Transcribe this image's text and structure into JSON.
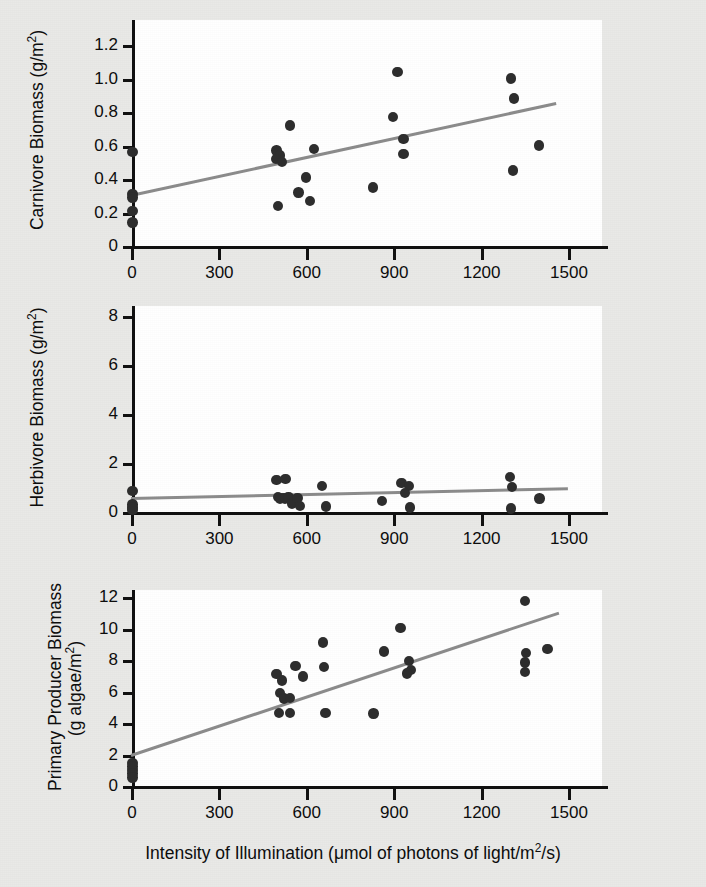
{
  "figure": {
    "background_color": "#e9e9e7",
    "plot_background_color": "#ffffff",
    "point_color": "#2e2e2e",
    "trend_color": "#8c8c8c",
    "axis_color": "#111111",
    "xlabel_main": "Intensity of Illumination (",
    "xlabel_mu": "μ",
    "xlabel_mid": "mol of photons of light/m",
    "xlabel_sup": "2",
    "xlabel_end": "/s)"
  },
  "xaxis": {
    "ticks": [
      0,
      300,
      600,
      900,
      1200,
      1500
    ],
    "tick_labels": [
      "0",
      "300",
      "600",
      "900",
      "1200",
      "1500"
    ],
    "min": 0,
    "max": 1560,
    "label": "Intensity of Illumination (μmol of photons of light/m2/s)"
  },
  "chart_data": [
    {
      "type": "scatter",
      "panel": 1,
      "title": "",
      "ylabel": "Carnivore Biomass (g/m2)",
      "ylabel_prefix": "Carnivore Biomass (g/m",
      "ylabel_sup": "2",
      "ylabel_suffix": ")",
      "xlabel": "",
      "ylim": [
        0,
        1.32
      ],
      "xlim": [
        0,
        1560
      ],
      "yticks": [
        0,
        0.2,
        0.4,
        0.6,
        0.8,
        1.0,
        1.2
      ],
      "ytick_labels": [
        "0",
        "0.2",
        "0.4",
        "0.6",
        "0.8",
        "1.0",
        "1.2"
      ],
      "grid": false,
      "legend": "none",
      "points": [
        {
          "x": 5,
          "y": 0.56
        },
        {
          "x": 5,
          "y": 0.31
        },
        {
          "x": 5,
          "y": 0.29
        },
        {
          "x": 5,
          "y": 0.21
        },
        {
          "x": 5,
          "y": 0.14
        },
        {
          "x": 500,
          "y": 0.57
        },
        {
          "x": 512,
          "y": 0.54
        },
        {
          "x": 498,
          "y": 0.52
        },
        {
          "x": 518,
          "y": 0.5
        },
        {
          "x": 505,
          "y": 0.24
        },
        {
          "x": 545,
          "y": 0.72
        },
        {
          "x": 575,
          "y": 0.32
        },
        {
          "x": 600,
          "y": 0.41
        },
        {
          "x": 615,
          "y": 0.27
        },
        {
          "x": 628,
          "y": 0.58
        },
        {
          "x": 830,
          "y": 0.35
        },
        {
          "x": 915,
          "y": 1.04
        },
        {
          "x": 900,
          "y": 0.77
        },
        {
          "x": 935,
          "y": 0.64
        },
        {
          "x": 935,
          "y": 0.55
        },
        {
          "x": 1305,
          "y": 1.0
        },
        {
          "x": 1315,
          "y": 0.88
        },
        {
          "x": 1312,
          "y": 0.45
        },
        {
          "x": 1400,
          "y": 0.6
        }
      ],
      "trendline": {
        "x0": 0,
        "y0": 0.3,
        "x1": 1460,
        "y1": 0.85
      }
    },
    {
      "type": "scatter",
      "panel": 2,
      "title": "",
      "ylabel": "Herbivore Biomass (g/m2)",
      "ylabel_prefix": "Herbivore Biomass (g/m",
      "ylabel_sup": "2",
      "ylabel_suffix": ")",
      "xlabel": "",
      "ylim": [
        0,
        9.2
      ],
      "xlim": [
        0,
        1560
      ],
      "yticks": [
        0,
        2,
        4,
        6,
        8
      ],
      "ytick_labels": [
        "0",
        "2",
        "4",
        "6",
        "8"
      ],
      "grid": false,
      "legend": "none",
      "points": [
        {
          "x": 5,
          "y": 0.85
        },
        {
          "x": 5,
          "y": 0.3
        },
        {
          "x": 5,
          "y": 0.18
        },
        {
          "x": 5,
          "y": 0.08
        },
        {
          "x": 500,
          "y": 1.3
        },
        {
          "x": 530,
          "y": 1.35
        },
        {
          "x": 505,
          "y": 0.62
        },
        {
          "x": 518,
          "y": 0.58
        },
        {
          "x": 512,
          "y": 0.52
        },
        {
          "x": 528,
          "y": 0.55
        },
        {
          "x": 540,
          "y": 0.6
        },
        {
          "x": 552,
          "y": 0.35
        },
        {
          "x": 572,
          "y": 0.58
        },
        {
          "x": 580,
          "y": 0.25
        },
        {
          "x": 655,
          "y": 1.05
        },
        {
          "x": 670,
          "y": 0.22
        },
        {
          "x": 862,
          "y": 0.45
        },
        {
          "x": 928,
          "y": 1.18
        },
        {
          "x": 955,
          "y": 1.05
        },
        {
          "x": 940,
          "y": 0.78
        },
        {
          "x": 958,
          "y": 0.18
        },
        {
          "x": 1300,
          "y": 1.42
        },
        {
          "x": 1308,
          "y": 1.02
        },
        {
          "x": 1305,
          "y": 0.15
        },
        {
          "x": 1402,
          "y": 0.55
        }
      ],
      "trendline": {
        "x0": 0,
        "y0": 0.55,
        "x1": 1500,
        "y1": 0.95
      }
    },
    {
      "type": "scatter",
      "panel": 3,
      "title": "",
      "ylabel": "Primary Producer Biomass (g algae/m2)",
      "ylabel_line1": "Primary Producer Biomass",
      "ylabel_line2_prefix": "(g algae/m",
      "ylabel_sup": "2",
      "ylabel_suffix": ")",
      "xlabel": "Intensity of Illumination (μmol of photons of light/m2/s)",
      "ylim": [
        0,
        13.2
      ],
      "xlim": [
        0,
        1560
      ],
      "yticks": [
        0,
        2,
        4,
        6,
        8,
        10,
        12
      ],
      "ytick_labels": [
        "0",
        "2",
        "4",
        "6",
        "8",
        "10",
        "12"
      ],
      "grid": false,
      "legend": "none",
      "points": [
        {
          "x": 5,
          "y": 1.45
        },
        {
          "x": 5,
          "y": 1.25
        },
        {
          "x": 5,
          "y": 1.0
        },
        {
          "x": 5,
          "y": 0.8
        },
        {
          "x": 5,
          "y": 0.55
        },
        {
          "x": 500,
          "y": 7.1
        },
        {
          "x": 518,
          "y": 6.7
        },
        {
          "x": 512,
          "y": 5.9
        },
        {
          "x": 525,
          "y": 5.55
        },
        {
          "x": 545,
          "y": 5.6
        },
        {
          "x": 508,
          "y": 4.65
        },
        {
          "x": 545,
          "y": 4.65
        },
        {
          "x": 565,
          "y": 7.6
        },
        {
          "x": 590,
          "y": 6.95
        },
        {
          "x": 660,
          "y": 9.1
        },
        {
          "x": 668,
          "y": 4.65
        },
        {
          "x": 662,
          "y": 7.55
        },
        {
          "x": 868,
          "y": 8.55
        },
        {
          "x": 925,
          "y": 10.05
        },
        {
          "x": 955,
          "y": 7.95
        },
        {
          "x": 962,
          "y": 7.35
        },
        {
          "x": 948,
          "y": 7.15
        },
        {
          "x": 832,
          "y": 4.6
        },
        {
          "x": 1352,
          "y": 11.75
        },
        {
          "x": 1355,
          "y": 8.45
        },
        {
          "x": 1352,
          "y": 7.85
        },
        {
          "x": 1352,
          "y": 7.25
        },
        {
          "x": 1430,
          "y": 8.7
        }
      ],
      "trendline": {
        "x0": 0,
        "y0": 1.95,
        "x1": 1470,
        "y1": 11.0
      }
    }
  ]
}
